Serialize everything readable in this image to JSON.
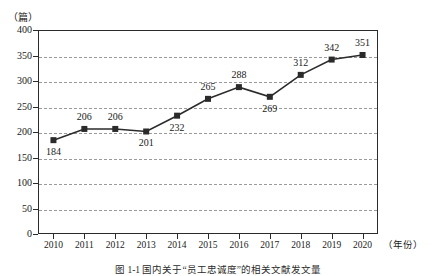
{
  "chart_data": {
    "type": "line",
    "title": "",
    "subtitle": "",
    "xlabel": "（年份）",
    "ylabel": "（篇）",
    "categories": [
      "2010",
      "2011",
      "2012",
      "2013",
      "2014",
      "2015",
      "2016",
      "2017",
      "2018",
      "2019",
      "2020"
    ],
    "values": [
      184,
      206,
      206,
      201,
      232,
      265,
      288,
      269,
      312,
      342,
      351
    ],
    "point_labels": [
      "184",
      "206",
      "206",
      "201",
      "232",
      "265",
      "288",
      "269",
      "312",
      "342",
      "351"
    ],
    "label_position": [
      "below",
      "above",
      "above",
      "below",
      "below",
      "above",
      "above",
      "below",
      "above",
      "above",
      "above"
    ],
    "ylim": [
      0,
      400
    ],
    "ytick_step": 50,
    "ytick_labels": [
      "400",
      "350",
      "300",
      "250",
      "200",
      "150",
      "100",
      "50",
      "0"
    ],
    "grid": "horizontal-dashed",
    "legend": "none",
    "marker": "square",
    "series_color": "#2b2b2b",
    "grid_color": "#9a9a9a",
    "axis_color": "#2b2b2b"
  },
  "caption": {
    "text": "图 1-1 国内关于“员工忠诚度”的相关文献发文量"
  }
}
